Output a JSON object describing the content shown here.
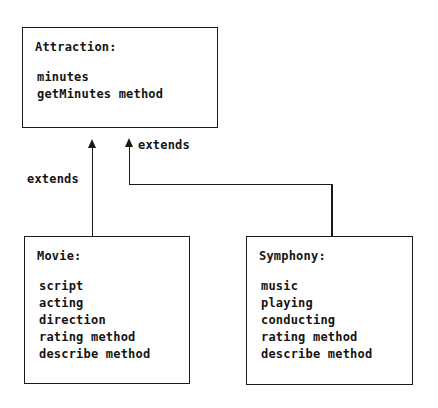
{
  "diagram": {
    "type": "uml-class-inheritance",
    "classes": [
      {
        "id": "attraction",
        "title": "Attraction:",
        "members": [
          "minutes",
          "getMinutes method"
        ]
      },
      {
        "id": "movie",
        "title": "Movie:",
        "members": [
          "script",
          "acting",
          "direction",
          "rating method",
          "describe method"
        ]
      },
      {
        "id": "symphony",
        "title": "Symphony:",
        "members": [
          "music",
          "playing",
          "conducting",
          "rating method",
          "describe method"
        ]
      }
    ],
    "relationships": [
      {
        "id": "movie-extends",
        "label": "extends",
        "from": "movie",
        "to": "attraction"
      },
      {
        "id": "symphony-extends",
        "label": "extends",
        "from": "symphony",
        "to": "attraction"
      }
    ],
    "colors": {
      "background": "#ffffff",
      "stroke": "#1a1a1a",
      "text": "#141414"
    }
  }
}
